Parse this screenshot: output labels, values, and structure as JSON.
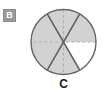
{
  "figure": {
    "part_badge": {
      "label": "B",
      "background_color": "#9a9a9a",
      "text_color": "#ffffff"
    },
    "caption": "C",
    "caption_color": "#1c1c1c",
    "background_color": "#ffffff"
  },
  "chart_data": {
    "type": "pie",
    "title": "",
    "subtitle": "",
    "xlabel": "",
    "ylabel": "",
    "grid": false,
    "legend_position": "none",
    "total_sectors": 6,
    "shaded_sectors": 5,
    "unshaded_sectors": 1,
    "fraction_shaded": "5/6",
    "sector_angle_degrees": 60,
    "categories": [
      "sector-1",
      "sector-2",
      "sector-3",
      "sector-4",
      "sector-5",
      "sector-6"
    ],
    "values": [
      60,
      60,
      60,
      60,
      60,
      60
    ],
    "sector_fills": [
      "#d2d2d2",
      "#d2d2d2",
      "#d2d2d2",
      "#d2d2d2",
      "#d2d2d2",
      "#ffffff"
    ],
    "sector_shaded": [
      true,
      true,
      true,
      true,
      true,
      false
    ],
    "sector_start_angles": [
      0,
      60,
      120,
      180,
      240,
      300
    ],
    "colors": {
      "shaded_fill": "#d2d2d2",
      "unshaded_fill": "#ffffff",
      "outline": "#666666",
      "solid_divider": "#5a5a5a",
      "dashed_divider": "#b0b0b0"
    },
    "dividers": [
      {
        "name": "horizontal-diameter",
        "style": "dashed",
        "angle_degrees": 0
      },
      {
        "name": "diagonal-diameter-up",
        "style": "solid",
        "angle_degrees": 60
      },
      {
        "name": "vertical-diameter",
        "style": "dashed",
        "angle_degrees": 90
      },
      {
        "name": "diagonal-diameter-down",
        "style": "solid",
        "angle_degrees": 120
      }
    ],
    "circle": {
      "center_x": 34.5,
      "center_y": 35,
      "radius": 32.5
    }
  }
}
